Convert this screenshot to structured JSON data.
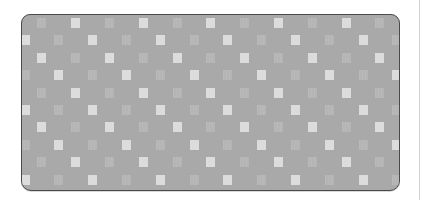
{
  "swatch": {
    "fill_color": "#a9a9a9",
    "border_color": "#4a4a4a",
    "bright_square_color": "#dcdcdc",
    "faint_square_color": "#b5b5b5",
    "grid": {
      "columns": 23,
      "rows": 10,
      "col_pitch": 16.9,
      "row_pitch": 17.4,
      "first_col_center_x": 3,
      "first_row_center_y": 8,
      "square_width": 9,
      "square_height": 10,
      "bright_rule": "(col - row) mod 4 == 3",
      "faint_rule": "(col - row) mod 4 == 1"
    }
  },
  "divider": {
    "color": "#d0d0d0"
  }
}
